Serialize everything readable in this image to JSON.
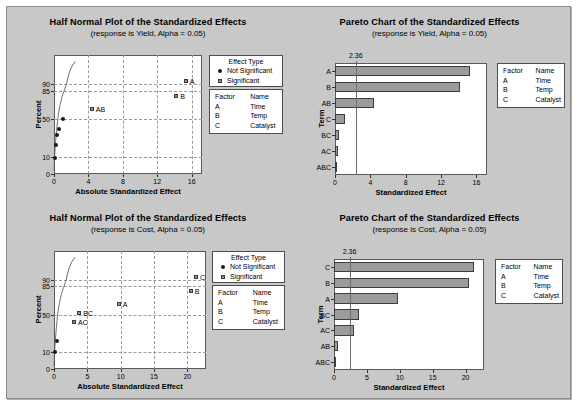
{
  "panels": [
    {
      "id": "halfnormal-yield",
      "title": "Half Normal Plot of the Standardized Effects",
      "subtitle": "(response is Yield, Alpha = 0.05)"
    },
    {
      "id": "pareto-yield",
      "title": "Pareto Chart of the Standardized Effects",
      "subtitle": "(response is Yield, Alpha = 0.05)"
    },
    {
      "id": "halfnormal-cost",
      "title": "Half Normal Plot of the Standardized Effects",
      "subtitle": "(response is Cost, Alpha = 0.05)"
    },
    {
      "id": "pareto-cost",
      "title": "Pareto Chart of the Standardized Effects",
      "subtitle": "(response is Cost, Alpha = 0.05)"
    }
  ],
  "effect_legend": {
    "title": "Effect Type",
    "items": [
      {
        "marker": "dot",
        "label": "Not Significant"
      },
      {
        "marker": "square",
        "label": "Significant"
      }
    ]
  },
  "factor_legend": {
    "headers": [
      "Factor",
      "Name"
    ],
    "rows": [
      {
        "factor": "A",
        "name": "Time"
      },
      {
        "factor": "B",
        "name": "Temp"
      },
      {
        "factor": "C",
        "name": "Catalyst"
      }
    ]
  },
  "colors": {
    "background": "#c8c8c8",
    "plot_area": "#ffffff",
    "bar_fill": "#9b9b9b",
    "bar_border": "#3d3d3d",
    "grid": "#9a9a9a",
    "axis": "#595959"
  },
  "chart_data": [
    {
      "type": "scatter",
      "id": "halfnormal-yield",
      "title": "Half Normal Plot of the Standardized Effects",
      "subtitle": "(response is Yield, Alpha = 0.05)",
      "xlabel": "Absolute Standardized Effect",
      "ylabel": "Percent",
      "xlim": [
        0,
        17.2
      ],
      "ylim": [
        0,
        99
      ],
      "xticks": [
        0,
        4,
        8,
        12,
        16
      ],
      "yticks": [
        0,
        10,
        50,
        85,
        90
      ],
      "grid": true,
      "points": [
        {
          "label": "",
          "x": 0.1,
          "y": 9.5,
          "type": "Not Significant"
        },
        {
          "label": "",
          "x": 0.25,
          "y": 22,
          "type": "Not Significant"
        },
        {
          "label": "",
          "x": 0.4,
          "y": 33,
          "type": "Not Significant"
        },
        {
          "label": "",
          "x": 0.55,
          "y": 40,
          "type": "Not Significant"
        },
        {
          "label": "",
          "x": 1.0,
          "y": 50,
          "type": "Not Significant"
        },
        {
          "label": "AB",
          "x": 4.4,
          "y": 62,
          "type": "Significant"
        },
        {
          "label": "B",
          "x": 14.2,
          "y": 79,
          "type": "Significant"
        },
        {
          "label": "A",
          "x": 15.3,
          "y": 91,
          "type": "Significant"
        }
      ]
    },
    {
      "type": "bar",
      "id": "pareto-yield",
      "title": "Pareto Chart of the Standardized Effects",
      "subtitle": "(response is Yield, Alpha = 0.05)",
      "xlabel": "Standardized Effect",
      "ylabel": "Term",
      "orientation": "horizontal",
      "xlim": [
        0,
        17.2
      ],
      "xticks": [
        0,
        4,
        8,
        12,
        16
      ],
      "categories": [
        "A",
        "B",
        "AB",
        "C",
        "BC",
        "AC",
        "ABC"
      ],
      "values": [
        15.3,
        14.2,
        4.4,
        1.1,
        0.5,
        0.3,
        0.12
      ],
      "reference_line": {
        "value": 2.36,
        "label": "2.36"
      }
    },
    {
      "type": "scatter",
      "id": "halfnormal-cost",
      "title": "Half Normal Plot of the Standardized Effects",
      "subtitle": "(response is Cost, Alpha = 0.05)",
      "xlabel": "Absolute Standardized Effect",
      "ylabel": "Percent",
      "xlim": [
        0,
        22.8
      ],
      "ylim": [
        0,
        99
      ],
      "xticks": [
        0,
        5,
        10,
        15,
        20
      ],
      "yticks": [
        0,
        10,
        50,
        85,
        90
      ],
      "grid": true,
      "points": [
        {
          "label": "",
          "x": 0.15,
          "y": 10,
          "type": "Not Significant"
        },
        {
          "label": "",
          "x": 0.5,
          "y": 22,
          "type": "Not Significant"
        },
        {
          "label": "AC",
          "x": 3.0,
          "y": 42,
          "type": "Significant"
        },
        {
          "label": "BC",
          "x": 3.8,
          "y": 52,
          "type": "Significant"
        },
        {
          "label": "A",
          "x": 9.7,
          "y": 63,
          "type": "Significant"
        },
        {
          "label": "B",
          "x": 20.5,
          "y": 79,
          "type": "Significant"
        },
        {
          "label": "C",
          "x": 21.3,
          "y": 91,
          "type": "Significant"
        }
      ]
    },
    {
      "type": "bar",
      "id": "pareto-cost",
      "title": "Pareto Chart of the Standardized Effects",
      "subtitle": "(response is Cost, Alpha = 0.05)",
      "xlabel": "Standardized Effect",
      "ylabel": "Term",
      "orientation": "horizontal",
      "xlim": [
        0,
        22.8
      ],
      "xticks": [
        0,
        5,
        10,
        15,
        20
      ],
      "categories": [
        "C",
        "B",
        "A",
        "BC",
        "AC",
        "AB",
        "ABC"
      ],
      "values": [
        21.3,
        20.5,
        9.7,
        3.8,
        3.0,
        0.55,
        0.15
      ],
      "reference_line": {
        "value": 2.36,
        "label": "2.36"
      }
    }
  ]
}
